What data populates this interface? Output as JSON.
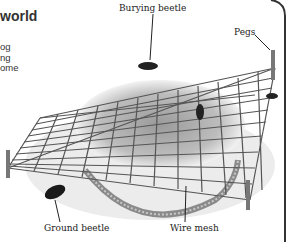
{
  "panel": {
    "heading": "world",
    "intro_lines": [
      "og",
      "ng",
      "ome"
    ]
  },
  "labels": {
    "burying_beetle": "Burying beetle",
    "pegs": "Pegs",
    "ground_beetle": "Ground beetle",
    "wire_mesh": "Wire mesh"
  },
  "colors": {
    "border": "#333333",
    "text": "#222222",
    "mesh": "#555555"
  }
}
